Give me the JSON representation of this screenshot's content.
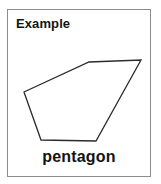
{
  "card": {
    "heading": "Example",
    "shape_name": "pentagon",
    "border_color": "#8c8c8c",
    "background_color": "#ffffff",
    "text_color": "#141414"
  },
  "shape": {
    "name": "pentagon",
    "sides": 5,
    "fill": "#ffffff",
    "stroke": "#2b2b2b",
    "stroke_width": 1.3,
    "points": "16,54 81,24 133,22 88,103 33,102",
    "vertices": [
      {
        "label": "left",
        "x": 16,
        "y": 54
      },
      {
        "label": "top-middle",
        "x": 81,
        "y": 24
      },
      {
        "label": "top-right",
        "x": 133,
        "y": 22
      },
      {
        "label": "bottom-right",
        "x": 88,
        "y": 103
      },
      {
        "label": "bottom-left",
        "x": 33,
        "y": 102
      }
    ]
  }
}
